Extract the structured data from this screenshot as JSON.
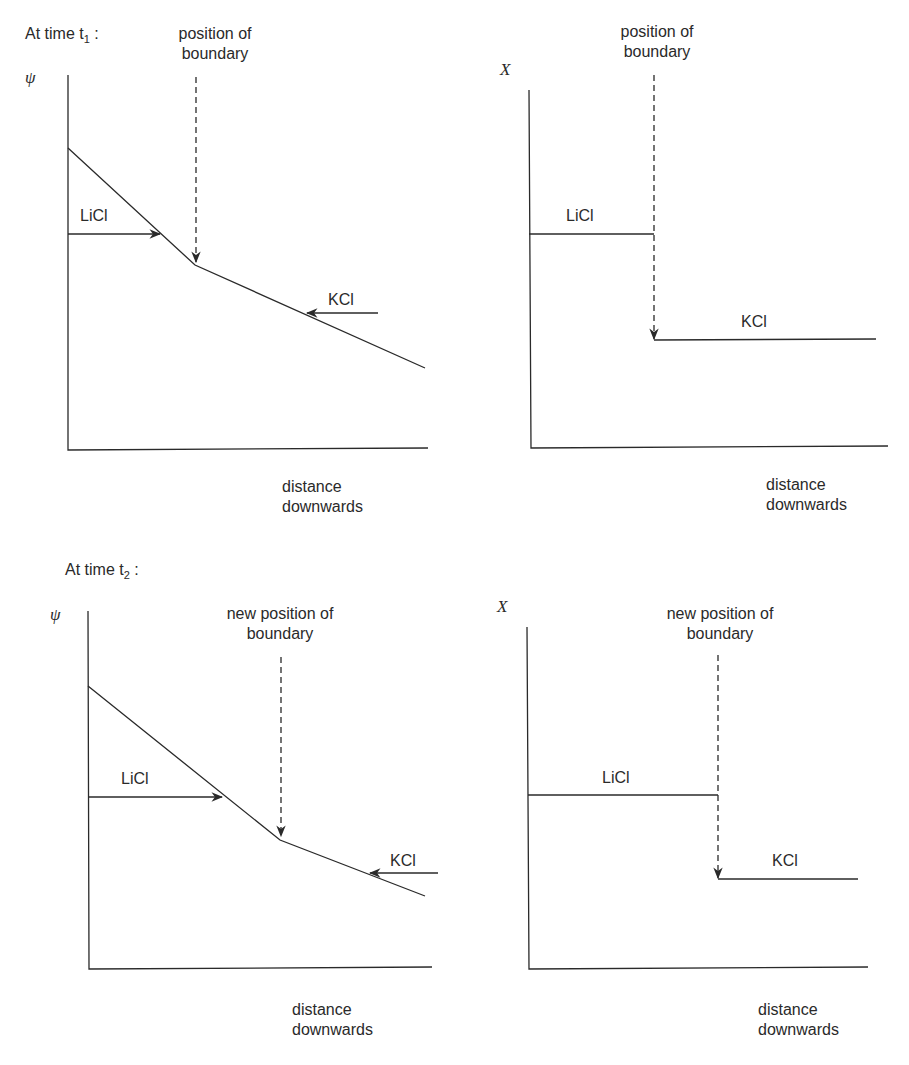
{
  "figure": {
    "section_t1": {
      "label": "At time t",
      "subscript": "1",
      "suffix": " :"
    },
    "section_t2": {
      "label": "At time t",
      "subscript": "2",
      "suffix": " :"
    },
    "panels": [
      {
        "id": "t1-potential",
        "y_axis": "ψ",
        "x_axis_line1": "distance",
        "x_axis_line2": "downwards",
        "boundary_line1": "position of",
        "boundary_line2": "boundary",
        "left_label": "LiCl",
        "right_label": "KCl"
      },
      {
        "id": "t1-concentration",
        "y_axis": "X",
        "x_axis_line1": "distance",
        "x_axis_line2": "downwards",
        "boundary_line1": "position of",
        "boundary_line2": "boundary",
        "left_label": "LiCl",
        "right_label": "KCl"
      },
      {
        "id": "t2-potential",
        "y_axis": "ψ",
        "x_axis_line1": "distance",
        "x_axis_line2": "downwards",
        "boundary_line1": "new position of",
        "boundary_line2": "boundary",
        "left_label": "LiCl",
        "right_label": "KCl"
      },
      {
        "id": "t2-concentration",
        "y_axis": "X",
        "x_axis_line1": "distance",
        "x_axis_line2": "downwards",
        "boundary_line1": "new position of",
        "boundary_line2": "boundary",
        "left_label": "LiCl",
        "right_label": "KCl"
      }
    ]
  },
  "colors": {
    "ink": "#2a2a2a",
    "background": "#ffffff"
  }
}
